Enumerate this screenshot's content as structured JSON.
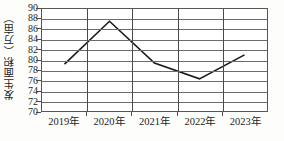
{
  "chart_data": {
    "type": "line",
    "title": "",
    "xlabel": "",
    "ylabel": "发生面积（万亩）",
    "categories": [
      "2019年",
      "2020年",
      "2021年",
      "2022年",
      "2023年"
    ],
    "values": [
      79.2,
      87.6,
      79.4,
      76.3,
      81.0
    ],
    "series": [
      {
        "name": "发生面积（万亩）",
        "values": [
          79.2,
          87.6,
          79.4,
          76.3,
          81.0
        ]
      }
    ],
    "ylim": [
      70,
      90
    ],
    "ytick_labels": [
      "90",
      "88",
      "86",
      "84",
      "82",
      "80",
      "78",
      "76",
      "74",
      "72",
      "70"
    ],
    "ytick_values": [
      90,
      88,
      86,
      84,
      82,
      80,
      78,
      76,
      74,
      72,
      70
    ],
    "grid": "both",
    "legend": "none",
    "line_color": "#1a1a1a",
    "grid_color": "#6b6b6b",
    "axis_color": "#555555"
  }
}
